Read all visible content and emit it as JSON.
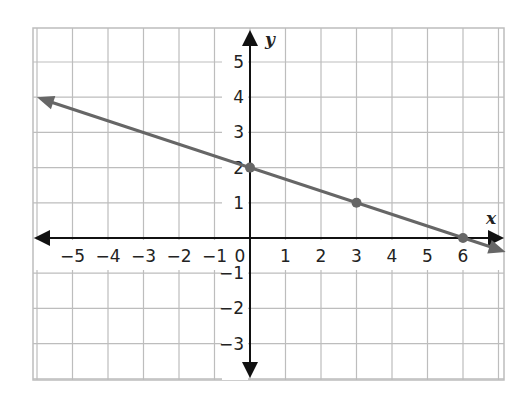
{
  "chart_data": {
    "type": "line",
    "title": "",
    "xlabel": "x",
    "ylabel": "y",
    "xlim": [
      -6,
      7
    ],
    "ylim": [
      -4,
      6
    ],
    "grid": true,
    "x_ticks": [
      "−5",
      "−4",
      "−3",
      "−2",
      "−1",
      "0",
      "1",
      "2",
      "3",
      "4",
      "5",
      "6"
    ],
    "y_ticks": [
      "5",
      "4",
      "3",
      "2",
      "1",
      "−1",
      "−2",
      "−3"
    ],
    "series": [
      {
        "name": "line",
        "equation": "y = -1/3 x + 2",
        "color": "#666666",
        "points": [
          {
            "x": 0,
            "y": 2
          },
          {
            "x": 3,
            "y": 1
          },
          {
            "x": 6,
            "y": 0
          }
        ],
        "extends": "both directions (arrows)"
      }
    ]
  },
  "labels": {
    "x_axis": "x",
    "y_axis": "y",
    "origin": "0"
  },
  "colors": {
    "grid": "#bdbdbd",
    "axis": "#111111",
    "line": "#666666",
    "point": "#666666"
  }
}
